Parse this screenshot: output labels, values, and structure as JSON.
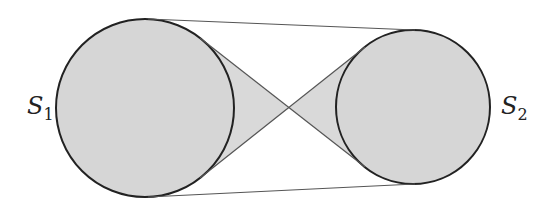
{
  "diagram": {
    "labels": {
      "s1": "S",
      "s1_sub": "1",
      "s2": "S",
      "s2_sub": "2"
    },
    "colors": {
      "fill": "#d6d6d6",
      "stroke": "#222222",
      "line": "#555555"
    }
  }
}
